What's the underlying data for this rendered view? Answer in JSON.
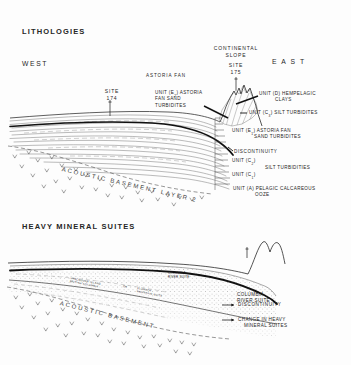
{
  "figure": {
    "panels": [
      {
        "id": "lithologies",
        "title": "LITHOLOGIES",
        "direction_west": "WEST",
        "direction_east": "E A S T",
        "feature_labels": [
          {
            "name": "continental-slope",
            "text": "CONTINENTAL\nSLOPE"
          },
          {
            "name": "astoria-fan",
            "text": "ASTORIA FAN"
          }
        ],
        "sites": [
          {
            "name": "site-174",
            "line1": "SITE",
            "line2": "174"
          },
          {
            "name": "site-175",
            "line1": "SITE",
            "line2": "175"
          }
        ],
        "annotations": [
          {
            "name": "unit-e2-label",
            "pre": "UNIT (E",
            "sub": "2",
            "post": ") ASTORIA",
            "line2": "FAN SAND",
            "line3": "TURBIDITES"
          },
          {
            "name": "unit-d-label",
            "pre": "UNIT (D) HEMPELAGIC",
            "line2": "CLAYS"
          },
          {
            "name": "unit-c3-label",
            "pre": "UNIT (C",
            "sub": "3",
            "post": ") SILT TURBIDITES"
          },
          {
            "name": "unit-e1-label",
            "pre": "UNIT (E",
            "sub": "1",
            "post": ") ASTORIA FAN",
            "line2": "SAND TURBIDITES"
          },
          {
            "name": "discontinuity-label",
            "pre": "DISCONTINUITY"
          },
          {
            "name": "unit-c2-label",
            "pre": "UNIT (C",
            "sub": "2",
            "post": ")"
          },
          {
            "name": "silt-turbidites-label",
            "pre": "SILT TURBIDITES"
          },
          {
            "name": "unit-c1-label",
            "pre": "UNIT (C",
            "sub": "1",
            "post": ")"
          },
          {
            "name": "unit-a-label",
            "pre": "UNIT (A) PELAGIC CALCAREOUS",
            "line2": "OOZE"
          }
        ],
        "basement_label": "ACOUSTIC   BASEMENT   LAYER  2"
      },
      {
        "id": "heavy-mineral-suites",
        "title": "HEAVY MINERAL SUITES",
        "annotations": [
          {
            "name": "columbia-river-suite-right",
            "line1": "COLUMBIA",
            "line2": "RIVER SUITE"
          },
          {
            "name": "columbia-river-suite-mid",
            "line1": "COLUMBIA",
            "line2": "RIVER SUITE"
          },
          {
            "name": "discontinuity-label-2",
            "line1": "DISCONTINUITY"
          },
          {
            "name": "change-in-heavy-mineral-suites-label",
            "line1": "CHANGE IN HEAVY",
            "line2": "MINERAL SUITES"
          }
        ],
        "curved_labels": [
          {
            "name": "vancouver-island-suite",
            "line1": "VANCOUVER  ISLAND",
            "line2": "BRITISH COLUMBIA"
          },
          {
            "name": "or-conjunction",
            "line1": "OR"
          },
          {
            "name": "klamath-mountain-suite",
            "line1": "KLAMATH",
            "line2": "MOUNTAIN  SUITE"
          }
        ],
        "basement_label": "ACOUSTIC   BASEMENT"
      }
    ],
    "colors": {
      "ink": "#1a1a1a",
      "paper": "#fdfdfd",
      "strata_line": "#555555",
      "heavy_line": "#111111",
      "stipple": "#6b6b6b"
    }
  }
}
